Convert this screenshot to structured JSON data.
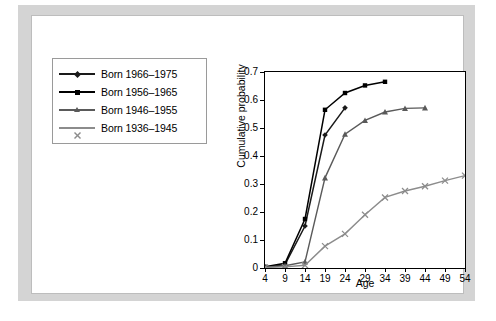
{
  "chart_data": {
    "type": "line",
    "title": "",
    "xlabel": "Age",
    "ylabel": "Cumulative probability",
    "xlim": [
      4,
      54
    ],
    "ylim": [
      0,
      0.7
    ],
    "grid": false,
    "legend_position": "upper-left-outside",
    "xticks": [
      4,
      9,
      14,
      19,
      24,
      29,
      34,
      39,
      44,
      49,
      54
    ],
    "yticks": [
      0,
      0.1,
      0.2,
      0.3,
      0.4,
      0.5,
      0.6,
      0.7
    ],
    "series": [
      {
        "name": "Born 1966–1975",
        "color": "#1a1a1a",
        "marker": "diamond",
        "x": [
          4,
          9,
          14,
          19,
          24
        ],
        "values": [
          0.003,
          0.012,
          0.15,
          0.475,
          0.572
        ]
      },
      {
        "name": "Born 1956–1965",
        "color": "#000000",
        "marker": "square",
        "x": [
          4,
          9,
          14,
          19,
          24,
          29,
          34
        ],
        "values": [
          0.004,
          0.017,
          0.175,
          0.565,
          0.625,
          0.652,
          0.665
        ]
      },
      {
        "name": "Born 1946–1955",
        "color": "#5a5a5a",
        "marker": "triangle",
        "x": [
          4,
          9,
          14,
          19,
          24,
          29,
          34,
          39,
          44
        ],
        "values": [
          0.003,
          0.008,
          0.022,
          0.322,
          0.478,
          0.527,
          0.557,
          0.57,
          0.572
        ]
      },
      {
        "name": "Born 1936–1945",
        "color": "#8c8c8c",
        "marker": "cross",
        "x": [
          4,
          9,
          14,
          19,
          24,
          29,
          34,
          39,
          44,
          49,
          54
        ],
        "values": [
          0.002,
          0.004,
          0.01,
          0.078,
          0.122,
          0.19,
          0.252,
          0.275,
          0.292,
          0.312,
          0.33
        ]
      }
    ]
  },
  "legend": {
    "items": [
      {
        "label": "Born 1966–1975"
      },
      {
        "label": "Born 1956–1965"
      },
      {
        "label": "Born 1946–1955"
      },
      {
        "label": "Born 1936–1945"
      }
    ]
  },
  "axes": {
    "x_title": "Age",
    "y_title": "Cumulative probability",
    "x_tick_labels": [
      "4",
      "9",
      "14",
      "19",
      "24",
      "29",
      "34",
      "39",
      "44",
      "49",
      "54"
    ],
    "y_tick_labels": [
      "0",
      "0.1",
      "0.2",
      "0.3",
      "0.4",
      "0.5",
      "0.6",
      "0.7"
    ]
  },
  "colors": {
    "panel_background": "#d4d4d4",
    "figure_background": "#ffffff",
    "axis": "#000000",
    "series_1": "#1a1a1a",
    "series_2": "#000000",
    "series_3": "#5a5a5a",
    "series_4": "#8c8c8c"
  }
}
